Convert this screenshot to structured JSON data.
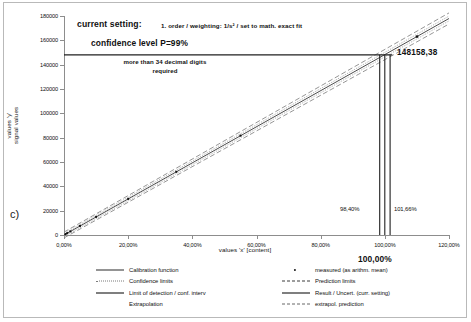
{
  "panel": {
    "label": "c)"
  },
  "axes": {
    "xlabel": "values 'x' [content]",
    "ylabel_line1": "values 'y'",
    "ylabel_line2": "signal values",
    "xticks": [
      "0,00%",
      "20,00%",
      "40,00%",
      "60,00%",
      "80,00%",
      "100,00%",
      "120,00%"
    ],
    "yticks": [
      "0",
      "20000",
      "40000",
      "60000",
      "80000",
      "100000",
      "120000",
      "140000",
      "160000",
      "180000"
    ]
  },
  "annotations": {
    "setting_label": "current setting:",
    "setting_value": "1. order / weighting:  1/s² / set to math. exact fit",
    "confidence": "confidence level P=99%",
    "note_line1": "more than 34 decimal digits",
    "note_line2": "required",
    "result_value": "148158,38",
    "lower_pct": "98,40%",
    "upper_pct": "101,66%",
    "target_pct": "100,00%"
  },
  "legend": {
    "left": [
      {
        "key": "solid-thin",
        "label": "Calibration function"
      },
      {
        "key": "dotted",
        "label": "Confidence limits"
      },
      {
        "key": "solid-thick",
        "label": "Limit of detection / conf. interv"
      },
      {
        "key": "blank",
        "label": "Extrapolation"
      }
    ],
    "right": [
      {
        "key": "dot",
        "label": "measured (as arithm. mean)"
      },
      {
        "key": "dashed-wide",
        "label": "Prediction limits"
      },
      {
        "key": "solid-thick",
        "label": "Result / Uncert. (curr. setting)"
      },
      {
        "key": "dashed",
        "label": "extrapol. prediction"
      }
    ]
  },
  "chart_data": {
    "type": "line",
    "title": "",
    "xlabel": "values 'x' [content]",
    "ylabel": "values 'y' / signal values",
    "xlim": [
      0,
      120
    ],
    "ylim": [
      0,
      180000
    ],
    "xtick_values": [
      0,
      20,
      40,
      60,
      80,
      100,
      120
    ],
    "ytick_values": [
      0,
      20000,
      40000,
      60000,
      80000,
      100000,
      120000,
      140000,
      160000,
      180000
    ],
    "grid": false,
    "legend_position": "bottom",
    "x_unit": "percent content",
    "y_unit": "signal",
    "series": [
      {
        "name": "Calibration function",
        "style": "solid",
        "x": [
          0,
          120
        ],
        "y": [
          0,
          178000
        ]
      },
      {
        "name": "measured (as arithm. mean)",
        "style": "points",
        "x": [
          0.5,
          1.0,
          2.0,
          5.0,
          10.0,
          20.0,
          35.0,
          55.0,
          110.0
        ],
        "y": [
          740,
          1480,
          2970,
          7420,
          14840,
          29680,
          51930,
          81590,
          163200
        ]
      },
      {
        "name": "Confidence limits (upper)",
        "style": "dotted",
        "x": [
          0,
          120
        ],
        "y": [
          1200,
          180000
        ]
      },
      {
        "name": "Confidence limits (lower)",
        "style": "dotted",
        "x": [
          0,
          120
        ],
        "y": [
          -1200,
          176000
        ]
      },
      {
        "name": "Prediction limits (upper)",
        "style": "dashed",
        "x": [
          0,
          120
        ],
        "y": [
          2400,
          182500
        ]
      },
      {
        "name": "Prediction limits (lower)",
        "style": "dashed",
        "x": [
          0,
          120
        ],
        "y": [
          -2400,
          173500
        ]
      }
    ],
    "markers": {
      "result_y": 148158.38,
      "result_label": "148158,38",
      "target_x": 100.0,
      "target_label": "100,00%",
      "uncertainty_lower_x": 98.4,
      "uncertainty_lower_label": "98,40%",
      "uncertainty_upper_x": 101.66,
      "uncertainty_upper_label": "101,66%"
    },
    "text_annotations": [
      "current setting:  1. order / weighting:  1/s² / set to math. exact fit",
      "confidence level P=99%",
      "more than 34 decimal digits required",
      "148158,38",
      "98,40%",
      "101,66%",
      "100,00%"
    ]
  }
}
